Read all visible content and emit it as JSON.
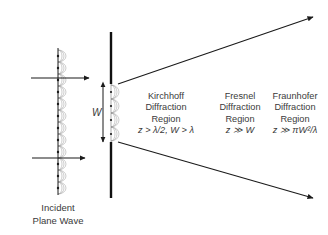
{
  "diagram": {
    "aperture_width_label": "W",
    "incident_label": [
      "Incident",
      "Plane Wave"
    ],
    "regions": [
      {
        "name": "kirchhoff",
        "lines": [
          "Kirchhoff",
          "Diffraction",
          "Region"
        ],
        "condition": "z > λ/2, W > λ"
      },
      {
        "name": "fresnel",
        "lines": [
          "Fresnel",
          "Diffraction",
          "Region"
        ],
        "condition": "z ≫ W"
      },
      {
        "name": "fraunhofer",
        "lines": [
          "Fraunhofer",
          "Diffraction",
          "Region"
        ],
        "condition": "z ≫ πW²/λ"
      }
    ],
    "colors": {
      "line": "#1a1a1a",
      "wavelet": "#9a9a9a",
      "text": "#3a3a3a"
    }
  }
}
